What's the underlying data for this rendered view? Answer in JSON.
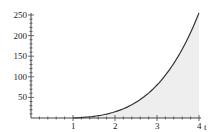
{
  "chart_data": {
    "type": "area",
    "title": "",
    "xlabel": "t",
    "ylabel": "",
    "xlim": [
      0,
      4
    ],
    "ylim": [
      0,
      250
    ],
    "x_ticks": [
      1,
      2,
      3,
      4
    ],
    "y_ticks": [
      50,
      100,
      150,
      200,
      250
    ],
    "grid": false,
    "series": [
      {
        "name": "curve",
        "x": [
          1,
          1.5,
          2,
          2.5,
          3,
          3.5,
          4
        ],
        "y": [
          0,
          4.1,
          15,
          38,
          80,
          149,
          255
        ]
      }
    ],
    "shaded_region": {
      "from": 1,
      "to": 4,
      "color": "#eeeeee"
    }
  },
  "axis": {
    "x_label": "t",
    "x_tick_labels": [
      "1",
      "2",
      "3",
      "4"
    ],
    "y_tick_labels": [
      "50",
      "100",
      "150",
      "200",
      "250"
    ]
  },
  "colors": {
    "curve": "#333333",
    "fill": "#eeeeee",
    "axis": "#444444"
  }
}
